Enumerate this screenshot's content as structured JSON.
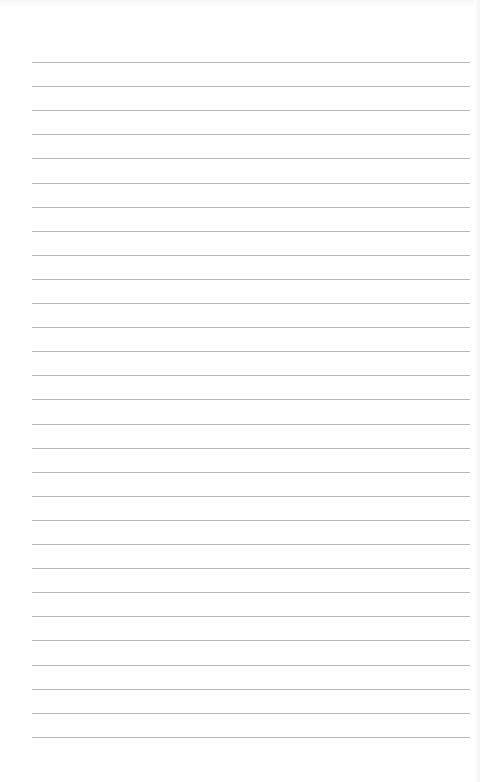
{
  "page": {
    "type": "lined-notepad-page",
    "background_color": "#ffffff",
    "rule_color": "#b8b8b8",
    "rules": {
      "count": 29,
      "first_y": 62,
      "spacing": 24.1,
      "left": 32,
      "right": 470
    }
  }
}
